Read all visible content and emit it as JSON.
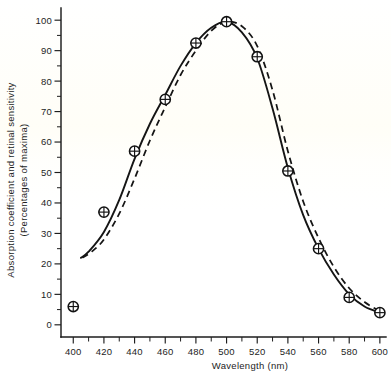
{
  "figure": {
    "caption_present": false,
    "background_color": "#ffffff",
    "ink_color": "#151515"
  },
  "chart_data": {
    "type": "line",
    "title": "",
    "xlabel": "Wavelength (nm)",
    "ylabel": "Absorption coefficient and retinal sensitivity (Percentages of maxima)",
    "ylabel_line1": "Absorption coefficient and retinal sensitivity",
    "ylabel_line2": "(Percentages of maxima)",
    "xlim": [
      392,
      604
    ],
    "ylim": [
      -4,
      104
    ],
    "xticks": [
      400,
      410,
      420,
      430,
      440,
      450,
      460,
      470,
      480,
      490,
      500,
      510,
      520,
      530,
      540,
      550,
      560,
      570,
      580,
      590,
      600
    ],
    "xtick_labels": [
      "400",
      "",
      "420",
      "",
      "440",
      "",
      "460",
      "",
      "480",
      "",
      "500",
      "",
      "520",
      "",
      "540",
      "",
      "560",
      "",
      "580",
      "",
      "600"
    ],
    "xticks_labeled": [
      400,
      420,
      440,
      460,
      480,
      500,
      520,
      540,
      560,
      580,
      600
    ],
    "yticks": [
      0,
      5,
      10,
      15,
      20,
      25,
      30,
      35,
      40,
      45,
      50,
      55,
      60,
      65,
      70,
      75,
      80,
      85,
      90,
      95,
      100
    ],
    "ytick_labels": [
      "0",
      "",
      "10",
      "",
      "20",
      "",
      "30",
      "",
      "40",
      "",
      "50",
      "",
      "60",
      "",
      "70",
      "",
      "80",
      "",
      "90",
      "",
      "100"
    ],
    "yticks_labeled": [
      0,
      10,
      20,
      30,
      40,
      50,
      60,
      70,
      80,
      90,
      100
    ],
    "grid": false,
    "legend": false,
    "legend_position": "none",
    "series": [
      {
        "name": "Retinal sensitivity (measured points)",
        "style": "markers",
        "marker": "circle-with-cross",
        "x": [
          400,
          420,
          440,
          460,
          480,
          500,
          520,
          540,
          560,
          580,
          600
        ],
        "values": [
          6,
          37,
          57,
          74,
          92.5,
          99.5,
          88,
          50.5,
          25,
          9,
          4
        ]
      },
      {
        "name": "Absorption coefficient (solid curve)",
        "style": "solid-line",
        "x": [
          405,
          410,
          420,
          430,
          440,
          450,
          460,
          470,
          480,
          490,
          500,
          510,
          520,
          530,
          540,
          550,
          560,
          570,
          580,
          590,
          600
        ],
        "values": [
          22,
          24,
          30.5,
          41,
          54.5,
          66,
          75.5,
          85,
          92.5,
          97.5,
          99.5,
          96,
          87.5,
          71,
          51.5,
          36,
          25,
          16.5,
          10,
          6,
          4
        ]
      },
      {
        "name": "Retinal sensitivity (dashed curve)",
        "style": "dashed-line",
        "x": [
          406,
          412,
          420,
          430,
          440,
          450,
          460,
          470,
          480,
          490,
          500,
          510,
          520,
          530,
          540,
          550,
          560,
          570,
          580,
          590,
          600
        ],
        "values": [
          22,
          24,
          28,
          36.5,
          48,
          60.5,
          71.5,
          82,
          90,
          96.5,
          99.5,
          98,
          91.5,
          77,
          57,
          40.5,
          28.5,
          19,
          12,
          7.5,
          4.5
        ]
      }
    ],
    "peak": {
      "x": 500,
      "y": 100
    },
    "annotations": []
  }
}
